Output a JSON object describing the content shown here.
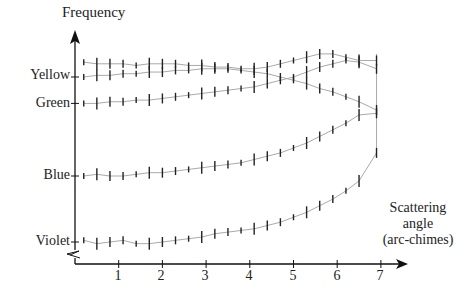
{
  "chart_data": {
    "type": "line",
    "title": "",
    "ylabel": "Frequency",
    "xlabel": "Scattering angle (arc-chimes)",
    "xlabel_lines": [
      "Scattering",
      "angle",
      "(arc-chimes)"
    ],
    "x_ticks": [
      "1",
      "2",
      "3",
      "4",
      "5",
      "6",
      "7"
    ],
    "xlim": [
      0,
      7.5
    ],
    "y_ticks": [
      {
        "label": "Violet",
        "value": 0
      },
      {
        "label": "Blue",
        "value": 40
      },
      {
        "label": "Green",
        "value": 84
      },
      {
        "label": "Yellow",
        "value": 100
      }
    ],
    "ylim": [
      -10,
      125
    ],
    "grid": false,
    "legend": "none",
    "error_bars": true,
    "series": [
      {
        "name": "Violet",
        "x": [
          0.2,
          0.5,
          0.8,
          1.1,
          1.4,
          1.7,
          2.0,
          2.3,
          2.6,
          2.9,
          3.2,
          3.5,
          3.8,
          4.1,
          4.4,
          4.7,
          5.0,
          5.3,
          5.6,
          5.9,
          6.2,
          6.5,
          6.9
        ],
        "y": [
          1,
          -1,
          0,
          1,
          -1,
          -1,
          0,
          1,
          2,
          3,
          5,
          6,
          7,
          8,
          10,
          12,
          15,
          18,
          22,
          26,
          31,
          37,
          54
        ]
      },
      {
        "name": "Blue",
        "x": [
          0.2,
          0.5,
          0.8,
          1.1,
          1.4,
          1.7,
          2.0,
          2.3,
          2.6,
          2.9,
          3.2,
          3.5,
          3.8,
          4.1,
          4.4,
          4.7,
          5.0,
          5.3,
          5.6,
          5.9,
          6.2,
          6.5,
          6.9
        ],
        "y": [
          40,
          41,
          40,
          40,
          41,
          42,
          42,
          43,
          44,
          45,
          46,
          47,
          48,
          50,
          52,
          54,
          57,
          60,
          64,
          68,
          72,
          77,
          78
        ]
      },
      {
        "name": "Green",
        "x": [
          0.2,
          0.5,
          0.8,
          1.1,
          1.4,
          1.7,
          2.0,
          2.3,
          2.6,
          2.9,
          3.2,
          3.5,
          3.8,
          4.1,
          4.4,
          4.7,
          5.0,
          5.3,
          5.6,
          5.9,
          6.2,
          6.5,
          6.9
        ],
        "y": [
          84,
          84,
          85,
          85,
          86,
          86,
          87,
          88,
          89,
          90,
          91,
          92,
          93,
          94,
          96,
          98,
          100,
          103,
          106,
          108,
          110,
          109,
          105
        ]
      },
      {
        "name": "Yellow",
        "x": [
          0.2,
          0.5,
          0.8,
          1.1,
          1.4,
          1.7,
          2.0,
          2.3,
          2.6,
          2.9,
          3.2,
          3.5,
          3.8,
          4.1,
          4.4,
          4.7,
          5.0,
          5.3,
          5.6,
          5.9,
          6.2,
          6.5,
          6.9
        ],
        "y": [
          100,
          101,
          101,
          102,
          102,
          103,
          103,
          104,
          104,
          105,
          105,
          105,
          104,
          103,
          102,
          100,
          98,
          96,
          93,
          91,
          88,
          85,
          80
        ]
      },
      {
        "name": "Red",
        "x": [
          0.2,
          0.5,
          0.8,
          1.1,
          1.4,
          1.7,
          2.0,
          2.3,
          2.6,
          2.9,
          3.2,
          3.5,
          3.8,
          4.1,
          4.4,
          4.7,
          5.0,
          5.3,
          5.6,
          5.9,
          6.2,
          6.5,
          6.9
        ],
        "y": [
          109,
          108,
          108,
          108,
          107,
          108,
          108,
          108,
          107,
          107,
          106,
          106,
          105,
          105,
          106,
          108,
          110,
          112,
          114,
          114,
          112,
          110,
          110
        ]
      }
    ]
  },
  "labels": {
    "y_axis_title": "Frequency",
    "y_violet": "Violet",
    "y_blue": "Blue",
    "y_green": "Green",
    "y_yellow": "Yellow",
    "x1": "1",
    "x2": "2",
    "x3": "3",
    "x4": "4",
    "x5": "5",
    "x6": "6",
    "x7": "7",
    "x_title_1": "Scattering",
    "x_title_2": "angle",
    "x_title_3": "(arc-chimes)"
  },
  "colors": {
    "axis": "#111111",
    "curve": "#aaaaaa",
    "bar": "#222222"
  }
}
